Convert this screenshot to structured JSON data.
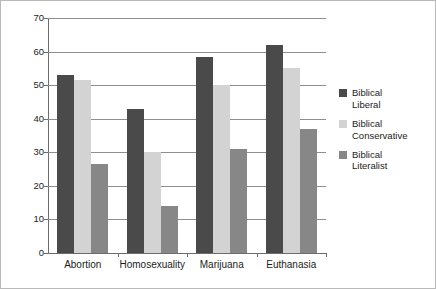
{
  "chart_data": {
    "type": "bar",
    "title": "",
    "subtitle": "",
    "xlabel": "",
    "ylabel": "",
    "ylim": [
      0,
      70
    ],
    "ytick_step": 10,
    "yticks": [
      "0",
      "10",
      "20",
      "30",
      "40",
      "50",
      "60",
      "70"
    ],
    "grid": true,
    "legend_position": "right",
    "categories": [
      "Abortion",
      "Homosexuality",
      "Marijuana",
      "Euthanasia"
    ],
    "series": [
      {
        "name": "Biblical Liberal",
        "name_line1": "Biblical",
        "name_line2": "Liberal",
        "color": "#4a4a4a",
        "values": [
          53,
          43,
          58.5,
          62
        ]
      },
      {
        "name": "Biblical Conservative",
        "name_line1": "Biblical",
        "name_line2": "Conservative",
        "color": "#d3d3d3",
        "values": [
          51.5,
          30,
          50,
          55
        ]
      },
      {
        "name": "Biblical Literalist",
        "name_line1": "Biblical",
        "name_line2": "Literalist",
        "color": "#878787",
        "values": [
          26.5,
          14,
          31,
          37
        ]
      }
    ]
  },
  "colors": {
    "series_liberal": "#4a4a4a",
    "series_conservative": "#d3d3d3",
    "series_literalist": "#878787",
    "axis": "#6b6b6b",
    "grid": "#8e8e8e",
    "text": "#1c1c1c",
    "background": "#ffffff",
    "border": "#b9b9b9"
  }
}
